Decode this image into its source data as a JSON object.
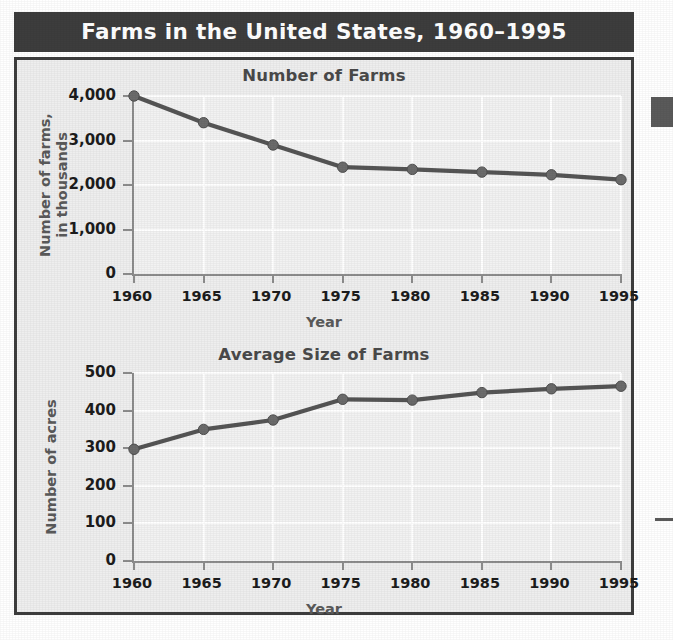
{
  "figure": {
    "title": "Farms in the United States, 1960–1995",
    "banner_color": "#3d3d3d",
    "panel_background": "#eeeeee",
    "plot_background": "#f2f2f2",
    "series_color": "#555555",
    "gridline_color": "#ffffff"
  },
  "chart_data": [
    {
      "type": "line",
      "title": "Number of Farms",
      "xlabel": "Year",
      "ylabel": "Number of farms,\nin thousands",
      "ylabel_line1": "Number of farms,",
      "ylabel_line2": "in thousands",
      "categories": [
        "1960",
        "1965",
        "1970",
        "1975",
        "1980",
        "1985",
        "1990",
        "1995"
      ],
      "x": [
        1960,
        1965,
        1970,
        1975,
        1980,
        1985,
        1990,
        1995
      ],
      "values": [
        4000,
        3400,
        2900,
        2400,
        2350,
        2290,
        2230,
        2120
      ],
      "ytick_labels": [
        "0",
        "1,000",
        "2,000",
        "3,000",
        "4,000"
      ],
      "ytick_values": [
        0,
        1000,
        2000,
        3000,
        4000
      ],
      "ylim": [
        0,
        4000
      ],
      "xlim": [
        1960,
        1995
      ],
      "grid": true,
      "legend": "none",
      "marker": "circle"
    },
    {
      "type": "line",
      "title": "Average Size of Farms",
      "xlabel": "Year",
      "ylabel": "Number of acres",
      "ylabel_line1": "Number of acres",
      "ylabel_line2": "",
      "categories": [
        "1960",
        "1965",
        "1970",
        "1975",
        "1980",
        "1985",
        "1990",
        "1995"
      ],
      "x": [
        1960,
        1965,
        1970,
        1975,
        1980,
        1985,
        1990,
        1995
      ],
      "values": [
        297,
        350,
        375,
        430,
        428,
        448,
        458,
        465
      ],
      "ytick_labels": [
        "0",
        "100",
        "200",
        "300",
        "400",
        "500"
      ],
      "ytick_values": [
        0,
        100,
        200,
        300,
        400,
        500
      ],
      "ylim": [
        0,
        500
      ],
      "xlim": [
        1960,
        1995
      ],
      "grid": true,
      "legend": "none",
      "marker": "circle"
    }
  ]
}
